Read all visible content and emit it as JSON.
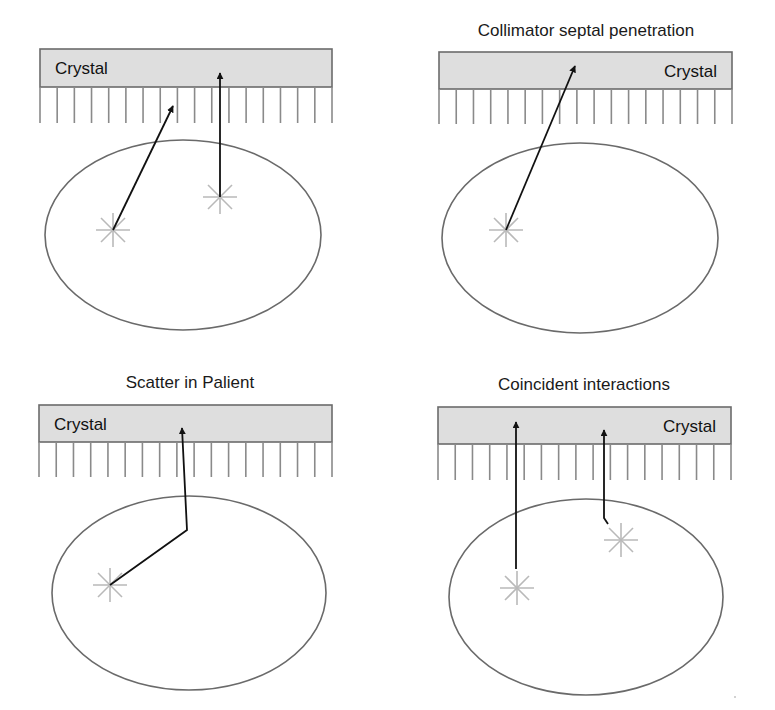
{
  "figure": {
    "panels": [
      {
        "id": "direct-and-penetration",
        "title": "",
        "crystal": {
          "label": "Crystal",
          "label_align": "left",
          "x": 40,
          "y": 49,
          "w": 292,
          "h": 38
        },
        "collimator": {
          "top": 87,
          "bottom": 123,
          "count": 18
        },
        "patient_ellipse": {
          "cx": 183,
          "cy": 235,
          "rx": 138,
          "ry": 95
        },
        "sources": [
          {
            "x": 113,
            "y": 230
          },
          {
            "x": 220,
            "y": 197
          }
        ],
        "rays": [
          {
            "points": [
              [
                113,
                230
              ],
              [
                173,
                106
              ]
            ]
          },
          {
            "points": [
              [
                220,
                197
              ],
              [
                220,
                73
              ]
            ]
          }
        ]
      },
      {
        "id": "collimator-septal-penetration",
        "title": "Collimator septal penetration",
        "crystal": {
          "label": "Crystal",
          "label_align": "right",
          "x": 439,
          "y": 52,
          "w": 293,
          "h": 37
        },
        "collimator": {
          "top": 89,
          "bottom": 124,
          "count": 18
        },
        "patient_ellipse": {
          "cx": 580,
          "cy": 238,
          "rx": 138,
          "ry": 95
        },
        "sources": [
          {
            "x": 506,
            "y": 230
          }
        ],
        "rays": [
          {
            "points": [
              [
                506,
                230
              ],
              [
                575,
                66
              ]
            ]
          }
        ]
      },
      {
        "id": "scatter-in-patient",
        "title": "Scatter in Palient",
        "crystal": {
          "label": "Crystal",
          "label_align": "left",
          "x": 39,
          "y": 405,
          "w": 293,
          "h": 37
        },
        "collimator": {
          "top": 442,
          "bottom": 477,
          "count": 18
        },
        "patient_ellipse": {
          "cx": 189,
          "cy": 593,
          "rx": 137,
          "ry": 97
        },
        "sources": [
          {
            "x": 110,
            "y": 585
          }
        ],
        "rays": [
          {
            "points": [
              [
                110,
                585
              ],
              [
                187,
                530
              ],
              [
                182,
                428
              ]
            ]
          }
        ]
      },
      {
        "id": "coincident-interactions",
        "title": "Coincident interactions",
        "crystal": {
          "label": "Crystal",
          "label_align": "right",
          "x": 438,
          "y": 407,
          "w": 293,
          "h": 37
        },
        "collimator": {
          "top": 444,
          "bottom": 480,
          "count": 18
        },
        "patient_ellipse": {
          "cx": 586,
          "cy": 597,
          "rx": 137,
          "ry": 98
        },
        "sources": [
          {
            "x": 517,
            "y": 588
          },
          {
            "x": 621,
            "y": 540
          }
        ],
        "rays": [
          {
            "points": [
              [
                516,
                569
              ],
              [
                516,
                422
              ]
            ]
          },
          {
            "points": [
              [
                608,
                524
              ],
              [
                604,
                518
              ],
              [
                604,
                430
              ]
            ]
          }
        ]
      }
    ],
    "colors": {
      "crystal_fill": "#dedede",
      "outline": "#6b6b6b",
      "ray": "#111111",
      "source_star": "#b9b9b9"
    }
  }
}
